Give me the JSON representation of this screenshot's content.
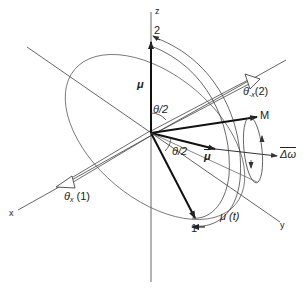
{
  "diagram": {
    "axes": {
      "z": "z",
      "x": "x",
      "y": "y"
    },
    "vectors": {
      "mu": "μ",
      "M": "M",
      "mu_bar": "μ",
      "delta_omega": "Δω",
      "mu_t": "μ (t)"
    },
    "points": {
      "one": "1",
      "two": "2"
    },
    "angles": {
      "half_theta_top": "θ/2",
      "half_theta_bottom": "θ/2"
    },
    "rotations": {
      "theta_x_1": {
        "symbol": "θ",
        "sub": "x",
        "arg": " (1)"
      },
      "theta_minus_x_2": {
        "symbol": "θ",
        "sub": "-x",
        "arg": "(2)"
      }
    },
    "colors": {
      "line": "#333333",
      "thin": "#555555"
    }
  }
}
